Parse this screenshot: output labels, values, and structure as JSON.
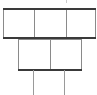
{
  "diagram": {
    "type": "block-grid",
    "line_color": "#8a8a8a",
    "heavy_line_color": "#3a3a3a",
    "rows": [
      {
        "name": "top-row",
        "cells": 3
      },
      {
        "name": "middle-row",
        "cells": 2
      },
      {
        "name": "stems",
        "count": 2
      }
    ]
  }
}
